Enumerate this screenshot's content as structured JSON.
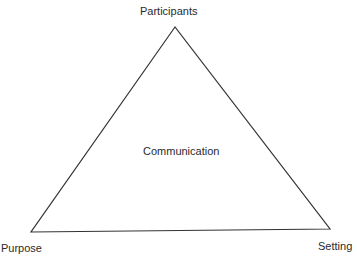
{
  "diagram": {
    "type": "triangle",
    "center_label": "Communication",
    "vertices": {
      "top": "Participants",
      "bottom_left": "Purpose",
      "bottom_right": "Setting"
    },
    "line_color": "#333333",
    "text_color": "#2a2a2a"
  }
}
